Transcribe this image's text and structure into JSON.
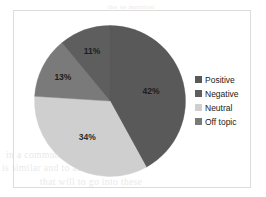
{
  "frame": {
    "border_color": "#dcdcdc",
    "background": "#ffffff"
  },
  "scan_bleed": {
    "top_line": "the se mention",
    "line_1": "in a communication  of  the",
    "line_2": "is  similar and  to  as the",
    "line_3": "that will  to  go  into  these"
  },
  "legend": {
    "position": "right",
    "items": [
      {
        "label": "Positive",
        "color": "#595959"
      },
      {
        "label": "Negative",
        "color": "#5e5e5e"
      },
      {
        "label": "Neutral",
        "color": "#cfcfcf"
      },
      {
        "label": "Off topic",
        "color": "#7a7a7a"
      }
    ]
  },
  "chart_data": {
    "type": "pie",
    "title": "",
    "start_angle_deg": 0,
    "direction": "clockwise",
    "categories": [
      "Positive",
      "Negative",
      "Neutral",
      "Off topic"
    ],
    "values": [
      42,
      11,
      34,
      13
    ],
    "value_unit": "%",
    "labels": [
      "42%",
      "11%",
      "34%",
      "13%"
    ],
    "colors": [
      "#595959",
      "#5e5e5e",
      "#cfcfcf",
      "#7a7a7a"
    ],
    "slices": [
      {
        "name": "Positive",
        "value": 42,
        "label": "42%",
        "color": "#595959",
        "start_deg": 0,
        "end_deg": 151.2,
        "label_fill": "on-dark"
      },
      {
        "name": "Neutral",
        "value": 34,
        "label": "34%",
        "color": "#cfcfcf",
        "start_deg": 151.2,
        "end_deg": 273.6,
        "label_fill": "on-light"
      },
      {
        "name": "Off topic",
        "value": 13,
        "label": "13%",
        "color": "#7a7a7a",
        "start_deg": 273.6,
        "end_deg": 320.4,
        "label_fill": "on-dark"
      },
      {
        "name": "Negative",
        "value": 11,
        "label": "11%",
        "color": "#5e5e5e",
        "start_deg": 320.4,
        "end_deg": 360,
        "label_fill": "on-dark"
      }
    ],
    "legend_position": "right",
    "grid": false
  }
}
